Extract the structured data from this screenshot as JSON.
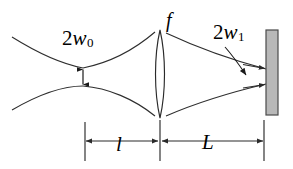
{
  "figure": {
    "type": "optics-ray-diagram",
    "background_color": "#ffffff",
    "stroke_color": "#000000",
    "line_color": "#3a3a3a",
    "screen_fill_color": "#b8b8b8",
    "screen_border_color": "#4a4a4a",
    "width": 293,
    "height": 169
  },
  "labels": {
    "beam_waist_input": {
      "name": "2w0",
      "coefficient": "2",
      "variable": "w",
      "subscript": "0",
      "meaning": "input beam waist diameter"
    },
    "beam_waist_output": {
      "name": "2w1",
      "coefficient": "2",
      "variable": "w",
      "subscript": "1",
      "meaning": "spot diameter at screen"
    },
    "focal_length": {
      "name": "f",
      "variable": "f",
      "meaning": "lens focal length"
    },
    "distance_before_lens": {
      "name": "l",
      "variable": "l",
      "meaning": "distance from waist to lens"
    },
    "distance_after_lens": {
      "name": "L",
      "variable": "L",
      "meaning": "distance from lens to screen"
    }
  },
  "elements": {
    "lens": {
      "label": "lens",
      "center_x": 160,
      "top_y": 30,
      "bottom_y": 118
    },
    "screen": {
      "label": "screen",
      "x": 266,
      "y": 30,
      "width": 12,
      "height": 85
    },
    "waist_arrow": {
      "label": "waist double arrow",
      "x": 83,
      "top_y": 68,
      "bottom_y": 86
    },
    "dimension_line": {
      "label": "dimension line",
      "y": 141,
      "left_x": 85,
      "mid_x": 160,
      "right_x": 264
    }
  }
}
